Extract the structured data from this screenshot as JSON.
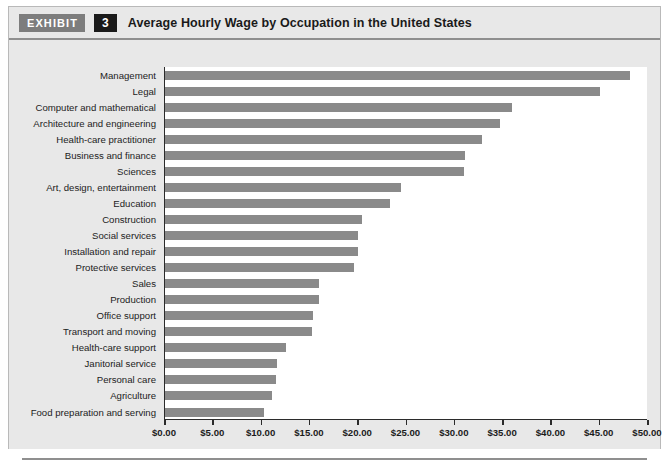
{
  "header": {
    "badge_label": "EXHIBIT",
    "badge_number": "3",
    "title": "Average Hourly Wage by Occupation in the United States"
  },
  "colors": {
    "bar": "#8a8a8a",
    "panel_background": "#e8e8e8",
    "plot_background": "#ffffff",
    "axis": "#2b2b2b",
    "badge_exhibit_bg": "#7d7d7d",
    "badge_number_bg": "#1a1a1a",
    "rule": "#8f8f8f"
  },
  "chart_data": {
    "type": "bar",
    "orientation": "horizontal",
    "title": "Average Hourly Wage by Occupation in the United States",
    "xlabel": "",
    "ylabel": "",
    "xlim": [
      0,
      50
    ],
    "grid": false,
    "legend": null,
    "xticks": [
      0,
      5,
      10,
      15,
      20,
      25,
      30,
      35,
      40,
      45,
      50
    ],
    "xtick_labels": [
      "$0.00",
      "$5.00",
      "$10.00",
      "$15.00",
      "$20.00",
      "$25.00",
      "$30.00",
      "$35.00",
      "$40.00",
      "$45.00",
      "$50.00"
    ],
    "categories": [
      "Management",
      "Legal",
      "Computer and mathematical",
      "Architecture and engineering",
      "Health-care practitioner",
      "Business and finance",
      "Sciences",
      "Art, design, entertainment",
      "Education",
      "Construction",
      "Social services",
      "Installation and repair",
      "Protective services",
      "Sales",
      "Production",
      "Office support",
      "Transport and moving",
      "Health-care support",
      "Janitorial service",
      "Personal care",
      "Agriculture",
      "Food preparation and serving"
    ],
    "values": [
      48.1,
      45.0,
      35.9,
      34.7,
      32.8,
      31.1,
      31.0,
      24.4,
      23.3,
      20.4,
      20.0,
      20.0,
      19.6,
      15.9,
      15.9,
      15.3,
      15.2,
      12.5,
      11.6,
      11.5,
      11.1,
      10.2
    ]
  }
}
